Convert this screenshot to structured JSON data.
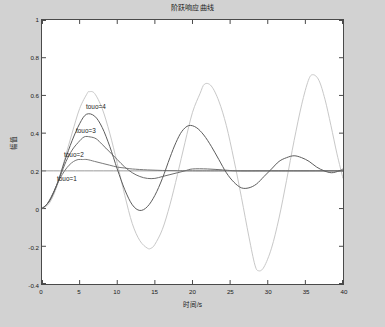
{
  "figure": {
    "title": "阶跃响应曲线",
    "background_color": "#d2d2d2",
    "axes_background_color": "#ffffff",
    "axes_border_color": "#4a4a4a"
  },
  "annotations": [
    {
      "id": "tou4",
      "label": "touo=4",
      "x_px": 86,
      "y_px": 103
    },
    {
      "id": "tou3",
      "label": "touo=3",
      "x_px": 76,
      "y_px": 127
    },
    {
      "id": "tou2",
      "label": "touo=2",
      "x_px": 64,
      "y_px": 151
    },
    {
      "id": "tou1",
      "label": "touo=1",
      "x_px": 57,
      "y_px": 175
    }
  ],
  "chart_data": {
    "type": "line",
    "title": "阶跃响应曲线",
    "xlabel": "时间/s",
    "ylabel": "幅值",
    "xlim": [
      0,
      40
    ],
    "ylim": [
      -0.4,
      1.0
    ],
    "xticks": [
      "0",
      "5",
      "10",
      "15",
      "20",
      "25",
      "30",
      "35",
      "40"
    ],
    "xtick_values": [
      0,
      5,
      10,
      15,
      20,
      25,
      30,
      35,
      40
    ],
    "yticks": [
      "1",
      "0.8",
      "0.6",
      "0.4",
      "0.2",
      "0",
      "-0.2",
      "-0.4"
    ],
    "ytick_values": [
      1,
      0.8,
      0.6,
      0.4,
      0.2,
      0,
      -0.2,
      -0.4
    ],
    "grid": false,
    "legend": "inline-annotations",
    "series": [
      {
        "name": "touo=1",
        "color": "#7a7a7a",
        "steady_state": 0.2,
        "peak_value": 0.26,
        "peak_time": 5.2,
        "description": "heavily damped, settles to 0.2 with no visible oscillation after t=12",
        "points": [
          [
            0,
            0
          ],
          [
            0.6,
            0.02
          ],
          [
            1.2,
            0.06
          ],
          [
            1.8,
            0.11
          ],
          [
            2.4,
            0.16
          ],
          [
            3,
            0.2
          ],
          [
            3.6,
            0.23
          ],
          [
            4.2,
            0.25
          ],
          [
            4.8,
            0.26
          ],
          [
            5.4,
            0.26
          ],
          [
            6,
            0.26
          ],
          [
            7,
            0.25
          ],
          [
            8,
            0.24
          ],
          [
            9,
            0.23
          ],
          [
            10,
            0.22
          ],
          [
            11,
            0.215
          ],
          [
            12,
            0.21
          ],
          [
            14,
            0.205
          ],
          [
            16,
            0.202
          ],
          [
            18,
            0.201
          ],
          [
            20,
            0.2
          ],
          [
            24,
            0.2
          ],
          [
            28,
            0.2
          ],
          [
            32,
            0.2
          ],
          [
            36,
            0.2
          ],
          [
            40,
            0.2
          ]
        ]
      },
      {
        "name": "touo=2",
        "color": "#6d6d6d",
        "steady_state": 0.2,
        "peak_value": 0.38,
        "peak_time": 5.6,
        "description": "lightly damped, small ripple dying out by t=20",
        "points": [
          [
            0,
            0
          ],
          [
            0.8,
            0.03
          ],
          [
            1.6,
            0.09
          ],
          [
            2.4,
            0.17
          ],
          [
            3.2,
            0.25
          ],
          [
            4,
            0.31
          ],
          [
            4.8,
            0.35
          ],
          [
            5.6,
            0.38
          ],
          [
            6.4,
            0.38
          ],
          [
            7.2,
            0.37
          ],
          [
            8,
            0.34
          ],
          [
            9,
            0.3
          ],
          [
            10,
            0.26
          ],
          [
            11,
            0.22
          ],
          [
            12,
            0.19
          ],
          [
            13,
            0.17
          ],
          [
            14,
            0.16
          ],
          [
            15,
            0.16
          ],
          [
            16,
            0.17
          ],
          [
            17,
            0.18
          ],
          [
            18,
            0.19
          ],
          [
            19,
            0.2
          ],
          [
            20,
            0.21
          ],
          [
            22,
            0.21
          ],
          [
            24,
            0.205
          ],
          [
            26,
            0.2
          ],
          [
            30,
            0.2
          ],
          [
            34,
            0.2
          ],
          [
            40,
            0.2
          ]
        ]
      },
      {
        "name": "touo=3",
        "color": "#5c5c5c",
        "steady_state": 0.2,
        "peak_value": 0.5,
        "peak_time": 5.9,
        "first_trough_value": 0.02,
        "first_trough_time": 12.0,
        "description": "under-damped, oscillation decaying, peaks ~0.50, 0.44, 0.28, 0.24",
        "points": [
          [
            0,
            0
          ],
          [
            1,
            0.04
          ],
          [
            2,
            0.13
          ],
          [
            3,
            0.25
          ],
          [
            4,
            0.36
          ],
          [
            5,
            0.45
          ],
          [
            5.9,
            0.5
          ],
          [
            7,
            0.49
          ],
          [
            8,
            0.43
          ],
          [
            9,
            0.33
          ],
          [
            10,
            0.21
          ],
          [
            11,
            0.1
          ],
          [
            12,
            0.02
          ],
          [
            13,
            -0.01
          ],
          [
            14,
            0.01
          ],
          [
            15,
            0.07
          ],
          [
            16,
            0.16
          ],
          [
            17,
            0.27
          ],
          [
            17.8,
            0.35
          ],
          [
            18.6,
            0.41
          ],
          [
            19.5,
            0.44
          ],
          [
            20.5,
            0.43
          ],
          [
            21.5,
            0.39
          ],
          [
            22.5,
            0.33
          ],
          [
            23.5,
            0.26
          ],
          [
            24.5,
            0.19
          ],
          [
            25.5,
            0.14
          ],
          [
            26.5,
            0.11
          ],
          [
            27.5,
            0.11
          ],
          [
            28.5,
            0.13
          ],
          [
            29.5,
            0.17
          ],
          [
            30.5,
            0.21
          ],
          [
            31.5,
            0.25
          ],
          [
            32.5,
            0.27
          ],
          [
            33.5,
            0.28
          ],
          [
            34.5,
            0.27
          ],
          [
            35.5,
            0.25
          ],
          [
            36.5,
            0.22
          ],
          [
            37.5,
            0.2
          ],
          [
            38.5,
            0.19
          ],
          [
            39.5,
            0.2
          ],
          [
            40,
            0.21
          ]
        ]
      },
      {
        "name": "touo=4",
        "color": "#c8c8c8",
        "steady_state": 0.2,
        "peak_value": 0.62,
        "peak_time": 6.3,
        "description": "most oscillatory, large sustained swings: peaks 0.62, 0.66, 0.71; troughs -0.21, -0.33, -0.30",
        "points": [
          [
            0,
            0
          ],
          [
            1,
            0.03
          ],
          [
            2,
            0.12
          ],
          [
            3,
            0.26
          ],
          [
            4,
            0.4
          ],
          [
            5,
            0.53
          ],
          [
            6,
            0.61
          ],
          [
            6.3,
            0.62
          ],
          [
            7,
            0.61
          ],
          [
            8,
            0.53
          ],
          [
            9,
            0.4
          ],
          [
            10,
            0.24
          ],
          [
            11,
            0.07
          ],
          [
            12,
            -0.08
          ],
          [
            13,
            -0.17
          ],
          [
            14,
            -0.21
          ],
          [
            14.5,
            -0.21
          ],
          [
            15,
            -0.19
          ],
          [
            16,
            -0.11
          ],
          [
            17,
            0.02
          ],
          [
            18,
            0.18
          ],
          [
            19,
            0.35
          ],
          [
            20,
            0.51
          ],
          [
            21,
            0.61
          ],
          [
            21.6,
            0.66
          ],
          [
            22.5,
            0.65
          ],
          [
            23.5,
            0.57
          ],
          [
            24.5,
            0.44
          ],
          [
            25.5,
            0.26
          ],
          [
            26.5,
            0.06
          ],
          [
            27.5,
            -0.15
          ],
          [
            28.3,
            -0.3
          ],
          [
            28.8,
            -0.33
          ],
          [
            29.5,
            -0.31
          ],
          [
            30.5,
            -0.21
          ],
          [
            31.5,
            -0.05
          ],
          [
            32.5,
            0.15
          ],
          [
            33.5,
            0.36
          ],
          [
            34.5,
            0.55
          ],
          [
            35.4,
            0.68
          ],
          [
            36,
            0.71
          ],
          [
            36.8,
            0.68
          ],
          [
            37.6,
            0.58
          ],
          [
            38.4,
            0.44
          ],
          [
            39.2,
            0.29
          ],
          [
            40,
            0.16
          ]
        ]
      },
      {
        "name": "steady-state-reference",
        "color": "#9a9a9a",
        "description": "flat horizontal reference trace at amplitude 0.2 spanning the full time axis",
        "points": [
          [
            0,
            0.2
          ],
          [
            40,
            0.2
          ]
        ]
      }
    ]
  }
}
